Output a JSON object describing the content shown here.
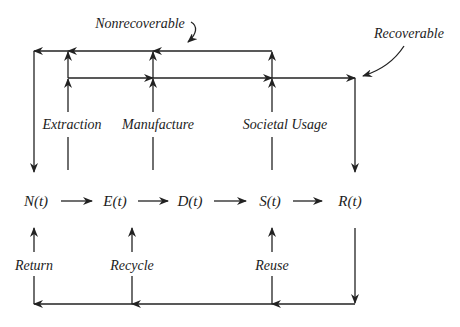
{
  "diagram": {
    "nodes": [
      {
        "id": "N",
        "label": "N(t)"
      },
      {
        "id": "E",
        "label": "E(t)"
      },
      {
        "id": "D",
        "label": "D(t)"
      },
      {
        "id": "S",
        "label": "S(t)"
      },
      {
        "id": "R",
        "label": "R(t)"
      }
    ],
    "process_labels": {
      "extraction": "Extraction",
      "manufacture": "Manufacture",
      "societal_usage": "Societal Usage"
    },
    "recovery_labels": {
      "return": "Return",
      "recycle": "Recycle",
      "reuse": "Reuse"
    },
    "annotations": {
      "nonrecoverable": "Nonrecoverable",
      "recoverable": "Recoverable"
    },
    "edges": [
      {
        "from": "N",
        "to": "E"
      },
      {
        "from": "E",
        "to": "D"
      },
      {
        "from": "D",
        "to": "S"
      },
      {
        "from": "S",
        "to": "R"
      },
      {
        "from": "Extraction",
        "to": "N",
        "type": "nonrecoverable"
      },
      {
        "from": "Manufacture",
        "to": "N",
        "type": "nonrecoverable"
      },
      {
        "from": "Societal Usage",
        "to": "N",
        "type": "nonrecoverable"
      },
      {
        "from": "Extraction",
        "to": "R",
        "type": "recoverable"
      },
      {
        "from": "Manufacture",
        "to": "R",
        "type": "recoverable"
      },
      {
        "from": "Societal Usage",
        "to": "R",
        "type": "recoverable"
      },
      {
        "from": "R",
        "to": "S",
        "type": "reuse"
      },
      {
        "from": "R",
        "to": "E",
        "type": "recycle"
      },
      {
        "from": "R",
        "to": "N",
        "type": "return"
      }
    ],
    "colors": {
      "line": "#222222",
      "text": "#1c1c1c",
      "background": "#ffffff"
    }
  }
}
